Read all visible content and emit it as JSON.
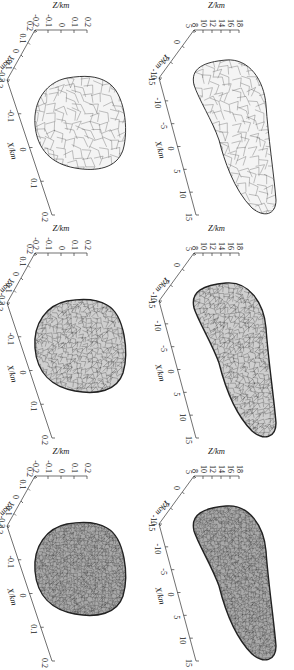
{
  "figure": {
    "orientation": "rotated-90-clockwise",
    "layout": {
      "rows": 2,
      "cols": 3
    },
    "panels": [
      {
        "row": 0,
        "col": 0,
        "body": "elongated",
        "mesh": "coarse",
        "z_label": "Z/km",
        "y_label": "Y/km",
        "x_label": "X/km",
        "z_ticks": [
          "18",
          "16",
          "14",
          "12",
          "10",
          "8"
        ],
        "y_ticks": [
          "5",
          "0",
          "-5",
          "-10"
        ],
        "x_ticks": [
          "-15",
          "-10",
          "-5",
          "0",
          "5",
          "10",
          "15"
        ]
      },
      {
        "row": 0,
        "col": 1,
        "body": "elongated",
        "mesh": "medium",
        "z_label": "Z/km",
        "y_label": "Y/km",
        "x_label": "X/km",
        "z_ticks": [
          "18",
          "16",
          "14",
          "12",
          "10",
          "8"
        ],
        "y_ticks": [
          "5",
          "0",
          "-5",
          "-10"
        ],
        "x_ticks": [
          "-15",
          "-10",
          "-5",
          "0",
          "5",
          "10",
          "15"
        ]
      },
      {
        "row": 0,
        "col": 2,
        "body": "elongated",
        "mesh": "fine",
        "z_label": "Z/km",
        "y_label": "Y/km",
        "x_label": "X/km",
        "z_ticks": [
          "18",
          "16",
          "14",
          "12",
          "10",
          "8"
        ],
        "y_ticks": [
          "5",
          "0",
          "-5",
          "-10"
        ],
        "x_ticks": [
          "-15",
          "-10",
          "-5",
          "0",
          "5",
          "10",
          "15"
        ]
      },
      {
        "row": 1,
        "col": 0,
        "body": "spheroid",
        "mesh": "coarse",
        "z_label": "Z/km",
        "y_label": "Y/km",
        "x_label": "X/km",
        "z_ticks": [
          "0.2",
          "0.1",
          "0",
          "-0.1",
          "-0.2"
        ],
        "y_ticks": [
          "0.2",
          "0.1",
          "0",
          "-0.1",
          "-0.2"
        ],
        "x_ticks": [
          "-0.2",
          "-0.1",
          "0",
          "0.1",
          "0.2"
        ]
      },
      {
        "row": 1,
        "col": 1,
        "body": "spheroid",
        "mesh": "medium",
        "z_label": "Z/km",
        "y_label": "Y/km",
        "x_label": "X/km",
        "z_ticks": [
          "0.2",
          "0.1",
          "0",
          "-0.1",
          "-0.2"
        ],
        "y_ticks": [
          "0.2",
          "0.1",
          "0",
          "-0.1",
          "-0.2"
        ],
        "x_ticks": [
          "-0.2",
          "-0.1",
          "0",
          "0.1",
          "0.2"
        ]
      },
      {
        "row": 1,
        "col": 2,
        "body": "spheroid",
        "mesh": "fine",
        "z_label": "Z/km",
        "y_label": "Y/km",
        "x_label": "X/km",
        "z_ticks": [
          "0.2",
          "0.1",
          "0",
          "-0.1",
          "-0.2"
        ],
        "y_ticks": [
          "0.2",
          "0.1",
          "0",
          "-0.1",
          "-0.2"
        ],
        "x_ticks": [
          "-0.2",
          "-0.1",
          "0",
          "0.1",
          "0.2"
        ]
      }
    ]
  }
}
